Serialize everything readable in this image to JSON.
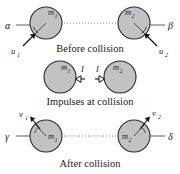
{
  "figure": {
    "title_text": "Oblique collision of two spheres",
    "background_color": "#ffffff",
    "ball_fill": "#c2c2c2",
    "ball_stroke": "#2b2b2b",
    "line_color": "#4d4d4d"
  },
  "panels": [
    {
      "id": "before",
      "caption": "Before collision",
      "bodies": [
        {
          "label": "m",
          "subscript": "1"
        },
        {
          "label": "m",
          "subscript": "2"
        }
      ],
      "angles": [
        {
          "symbol": "α",
          "name": "alpha"
        },
        {
          "symbol": "β",
          "name": "beta"
        }
      ],
      "velocities": [
        {
          "label": "u",
          "subscript": "1"
        },
        {
          "label": "u",
          "subscript": "2"
        }
      ]
    },
    {
      "id": "impulses",
      "caption": "Impulses at collision",
      "bodies": [
        {
          "label": "m",
          "subscript": "1"
        },
        {
          "label": "m",
          "subscript": "2"
        }
      ],
      "impulses": [
        {
          "label": "I"
        },
        {
          "label": "I"
        }
      ]
    },
    {
      "id": "after",
      "caption": "After collision",
      "bodies": [
        {
          "label": "m",
          "subscript": "1"
        },
        {
          "label": "m",
          "subscript": "2"
        }
      ],
      "angles": [
        {
          "symbol": "γ",
          "name": "gamma"
        },
        {
          "symbol": "δ",
          "name": "delta"
        }
      ],
      "velocities": [
        {
          "label": "v",
          "subscript": "1"
        },
        {
          "label": "v",
          "subscript": "2"
        }
      ]
    }
  ]
}
